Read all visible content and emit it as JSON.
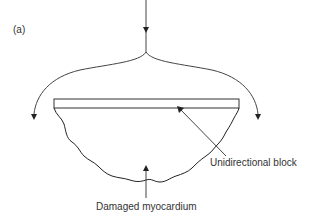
{
  "figure": {
    "panel_label": "(a)",
    "labels": {
      "unidirectional_block": "Unidirectional block",
      "damaged_myocardium": "Damaged myocardium"
    },
    "colors": {
      "stroke": "#333333",
      "background": "#ffffff"
    }
  }
}
